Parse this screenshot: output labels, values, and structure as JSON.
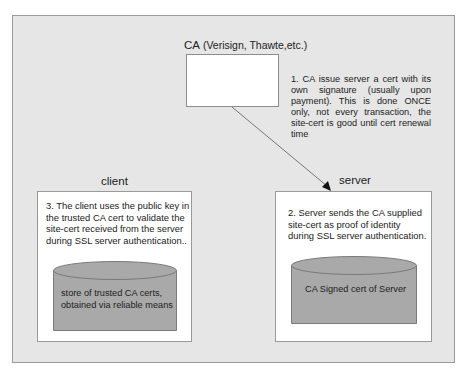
{
  "diagram": {
    "ca": {
      "label_main": "CA",
      "label_sub": " (Verisign, Thawte,etc.)"
    },
    "note_ca": "1. CA issue server a cert with its own signature (usually upon payment). This is done ONCE only, not every transaction, the site-cert is good until cert renewal time",
    "client": {
      "label": "client",
      "text_lines": [
        "3. The client uses the public key in",
        "the trusted CA cert to validate the",
        "site-cert received from the server",
        "during SSL server authentication.."
      ],
      "store": {
        "lines": [
          "store of trusted CA certs,",
          "obtained via reliable means"
        ]
      }
    },
    "server": {
      "label": "server",
      "text_lines": [
        "2. Server sends the CA supplied",
        "site-cert as proof of identity",
        "during SSL server authentication."
      ],
      "store": {
        "lines": [
          "CA Signed cert of Server"
        ]
      }
    },
    "colors": {
      "panel_bg": "#e6e6e6",
      "cylinder_fill": "#a9a9a9",
      "cylinder_stroke": "#7a7a7a",
      "box_bg": "#ffffff",
      "arrow": "#555555"
    }
  }
}
